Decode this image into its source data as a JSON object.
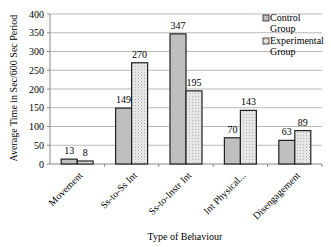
{
  "chart_data": {
    "type": "bar",
    "title": "",
    "xlabel": "Type of Behaviour",
    "ylabel": "Average Time in Sec/600 Sec Period",
    "ylim": [
      0,
      400
    ],
    "yticks": [
      0,
      50,
      100,
      150,
      200,
      250,
      300,
      350,
      400
    ],
    "grid": true,
    "legend_position": "top-right",
    "categories": [
      "Movement",
      "Ss-to-Ss Int",
      "Ss-to-Instr Int",
      "Int Physical...",
      "Disengagement"
    ],
    "series": [
      {
        "name": "Control Group",
        "values": [
          13,
          149,
          347,
          70,
          63
        ],
        "color": "#bfbfbf"
      },
      {
        "name": "Experimental Group",
        "values": [
          8,
          270,
          195,
          143,
          89
        ],
        "color": "#e3e3e3"
      }
    ]
  },
  "legend": {
    "control_line1": "Control",
    "control_line2": "Group",
    "experimental_line1": "Experimental",
    "experimental_line2": "Group"
  }
}
